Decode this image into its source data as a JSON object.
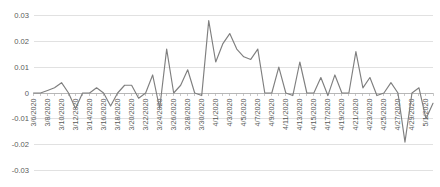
{
  "chart_data": {
    "type": "line",
    "title": "",
    "subtitle": "",
    "xlabel": "",
    "ylabel": "",
    "legend": [],
    "legend_position": "none",
    "grid": true,
    "ylim": [
      -0.03,
      0.03
    ],
    "yticks": [
      0.03,
      0.02,
      0.01,
      0,
      -0.01,
      -0.02,
      -0.03
    ],
    "ytick_labels": [
      "0.03",
      "0.02",
      "0.01",
      "0",
      "-0.01",
      "-0.02",
      "-0.03"
    ],
    "xtick_labels": [
      "3/6/2020",
      "3/8/2020",
      "3/10/2020",
      "3/12/2020",
      "3/14/2020",
      "3/16/2020",
      "3/18/2020",
      "3/20/2020",
      "3/22/2020",
      "3/24/2020",
      "3/26/2020",
      "3/28/2020",
      "3/30/2020",
      "4/1/2020",
      "4/3/2020",
      "4/5/2020",
      "4/7/2020",
      "4/9/2020",
      "4/11/2020",
      "4/13/2020",
      "4/15/2020",
      "4/17/2020",
      "4/19/2020",
      "4/21/2020",
      "4/23/2020",
      "4/25/2020",
      "4/27/2020",
      "4/29/2020",
      "5/1/2020"
    ],
    "xtick_step": 2,
    "line_color": "#7f7f7f",
    "grid_color": "#d9d9d9",
    "background_color": "#ffffff",
    "categories": [
      "3/6/2020",
      "3/7/2020",
      "3/8/2020",
      "3/9/2020",
      "3/10/2020",
      "3/11/2020",
      "3/12/2020",
      "3/13/2020",
      "3/14/2020",
      "3/15/2020",
      "3/16/2020",
      "3/17/2020",
      "3/18/2020",
      "3/19/2020",
      "3/20/2020",
      "3/21/2020",
      "3/22/2020",
      "3/23/2020",
      "3/24/2020",
      "3/25/2020",
      "3/26/2020",
      "3/27/2020",
      "3/28/2020",
      "3/29/2020",
      "3/30/2020",
      "3/31/2020",
      "4/1/2020",
      "4/2/2020",
      "4/3/2020",
      "4/4/2020",
      "4/5/2020",
      "4/6/2020",
      "4/7/2020",
      "4/8/2020",
      "4/9/2020",
      "4/10/2020",
      "4/11/2020",
      "4/12/2020",
      "4/13/2020",
      "4/14/2020",
      "4/15/2020",
      "4/16/2020",
      "4/17/2020",
      "4/18/2020",
      "4/19/2020",
      "4/20/2020",
      "4/21/2020",
      "4/22/2020",
      "4/23/2020",
      "4/24/2020",
      "4/25/2020",
      "4/26/2020",
      "4/27/2020",
      "4/28/2020",
      "4/29/2020",
      "4/30/2020",
      "5/1/2020",
      "5/2/2020"
    ],
    "values": [
      0.0,
      0.0,
      0.001,
      0.002,
      0.004,
      0.0,
      -0.006,
      0.0,
      0.0,
      0.002,
      0.0,
      -0.005,
      0.0,
      0.003,
      0.003,
      -0.002,
      0.0,
      0.007,
      -0.006,
      0.017,
      0.0,
      0.003,
      0.009,
      0.0,
      -0.001,
      0.028,
      0.012,
      0.019,
      0.023,
      0.017,
      0.014,
      0.013,
      0.017,
      0.0,
      0.0,
      0.01,
      0.0,
      -0.001,
      0.012,
      0.0,
      0.0,
      0.006,
      -0.001,
      0.007,
      0.0,
      0.0,
      0.016,
      0.002,
      0.006,
      -0.001,
      0.0,
      0.004,
      0.0,
      -0.019,
      0.0,
      0.002,
      -0.01,
      -0.004
    ]
  }
}
